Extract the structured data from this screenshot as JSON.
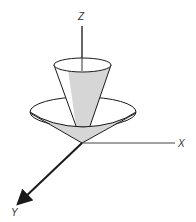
{
  "diagram": {
    "axes": {
      "z_label": "Z",
      "x_label": "X",
      "y_label": "Y"
    },
    "colors": {
      "stroke": "#1a1a1a",
      "fill_shaded": "#d6d6d6",
      "fill_light": "#ffffff",
      "label": "#333333"
    }
  }
}
